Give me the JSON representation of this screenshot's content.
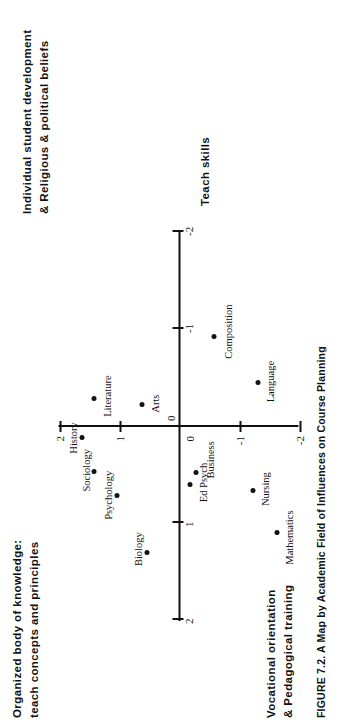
{
  "figure": {
    "caption_number": "FIGURE 7.2.",
    "caption_text": "A Map by Academic Field of Influences on Course Planning",
    "orientation": "page-rotated-90-ccw"
  },
  "axis_titles": {
    "top_right": "Individual student development\n& Religious &  political beliefs",
    "top_left": "Organized  body of knowledge:\nteach concepts and principles",
    "bottom_left": "Vocational orientation\n& Pedagogical training",
    "bottom_right": "Teach skills"
  },
  "chart_data": {
    "type": "scatter",
    "title": "A Map by Academic Field of Influences on Course Planning",
    "xlabel": "Organized body of knowledge: teach concepts and principles  ↔  Teach skills",
    "ylabel": "Individual student development & Religious & political beliefs  ↔  Vocational orientation & Pedagogical training",
    "xlim": [
      2,
      -2
    ],
    "ylim": [
      2,
      -2
    ],
    "xticks": [
      2,
      1,
      0,
      -1,
      -2
    ],
    "xtick_labels": [
      "2",
      "1",
      "0",
      "-1",
      "-2"
    ],
    "yticks": [
      2,
      1,
      0,
      -1,
      -2
    ],
    "ytick_labels": [
      "2",
      "1",
      "0",
      "-1",
      "-2"
    ],
    "grid": false,
    "legend": false,
    "points": [
      {
        "label": "Biology",
        "x": 1.3,
        "y": 0.55
      },
      {
        "label": "Psychology",
        "x": 0.72,
        "y": 1.05
      },
      {
        "label": "Sociology",
        "x": 0.47,
        "y": 1.42
      },
      {
        "label": "History",
        "x": 0.12,
        "y": 1.62
      },
      {
        "label": "Literature",
        "x": -0.28,
        "y": 1.42
      },
      {
        "label": "Arts",
        "x": -0.22,
        "y": 0.62
      },
      {
        "label": "Ed Psych",
        "x": 0.6,
        "y": -0.18
      },
      {
        "label": "Business",
        "x": 0.48,
        "y": -0.27
      },
      {
        "label": "Nursing",
        "x": 0.66,
        "y": -1.22
      },
      {
        "label": "Mathematics",
        "x": 1.1,
        "y": -1.62
      },
      {
        "label": "Language",
        "x": -0.45,
        "y": -1.3
      },
      {
        "label": "Composition",
        "x": -0.92,
        "y": -0.58
      }
    ]
  }
}
